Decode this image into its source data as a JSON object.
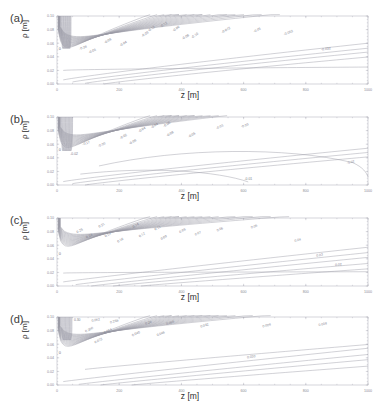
{
  "figure": {
    "faint_header": "",
    "panels": [
      {
        "tag": "(a)",
        "xlabel": "z [m]",
        "ylabel": "ρ [m]"
      },
      {
        "tag": "(b)",
        "xlabel": "z [m]",
        "ylabel": "ρ [m]"
      },
      {
        "tag": "(c)",
        "xlabel": "z [m]",
        "ylabel": "ρ [m]"
      },
      {
        "tag": "(d)",
        "xlabel": "z [m]",
        "ylabel": "ρ [m]"
      }
    ]
  },
  "chart_data": [
    {
      "type": "line",
      "panel": "(a)",
      "title": "",
      "xlabel": "z [m]",
      "ylabel": "ρ [m]",
      "xlim": [
        0,
        1000
      ],
      "ylim": [
        0.0,
        0.1
      ],
      "xticks": [
        0,
        200,
        400,
        600,
        800,
        1000
      ],
      "xticklabels": [
        "0",
        "200",
        "400",
        "600",
        "800",
        "1000"
      ],
      "yticks": [
        0.0,
        0.02,
        0.04,
        0.06,
        0.08,
        0.1
      ],
      "yticklabels": [
        "0.00",
        "0.02",
        "0.04",
        "0.06",
        "0.08",
        "0.10"
      ],
      "grid": false,
      "legend": "none",
      "contour_labels": [
        "0",
        "-0.28",
        "-0.08",
        "-0.08",
        "-0.04",
        "-0.09",
        "-0.12",
        "-0.12",
        "-0.06",
        "-0.08",
        "-0.10",
        "-0.072",
        "-0.05",
        "-0.052",
        "-0.032",
        "-0.048",
        "-0.004"
      ],
      "notes": "Contours fan out from a dense dark cluster at upper-left; one near-horizontal contour labelled -0.004 extends to the right edge."
    },
    {
      "type": "line",
      "panel": "(b)",
      "title": "",
      "xlabel": "z [m]",
      "ylabel": "ρ [m]",
      "xlim": [
        0,
        1000
      ],
      "ylim": [
        0.0,
        0.1
      ],
      "xticks": [
        0,
        200,
        400,
        600,
        800,
        1000
      ],
      "xticklabels": [
        "0",
        "200",
        "400",
        "600",
        "800",
        "1000"
      ],
      "yticks": [
        0.0,
        0.02,
        0.04,
        0.06,
        0.08,
        0.1
      ],
      "yticklabels": [
        "0.00",
        "0.02",
        "0.04",
        "0.06",
        "0.08",
        "0.10"
      ],
      "grid": false,
      "legend": "none",
      "contour_labels": [
        "0",
        "-0.02",
        "-0.17",
        "-0.08",
        "-0.02",
        "-0.06",
        "-0.04",
        "-0.04",
        "-0.06",
        "-0.08",
        "-0.05",
        "-0.03",
        "-0.03",
        "-0.01",
        "-0.02",
        "-0.01"
      ],
      "notes": "Similar fan pattern to (a) but two contours close on themselves: one arcs to the right edge near ρ=0.03 and one turns down to the axis near z=620."
    },
    {
      "type": "line",
      "panel": "(c)",
      "title": "",
      "xlabel": "z [m]",
      "ylabel": "ρ [m]",
      "xlim": [
        0,
        1000
      ],
      "ylim": [
        0.0,
        0.1
      ],
      "xticks": [
        0,
        200,
        400,
        600,
        800,
        1000
      ],
      "xticklabels": [
        "0",
        "200",
        "400",
        "600",
        "800",
        "1000"
      ],
      "yticks": [
        0.0,
        0.02,
        0.04,
        0.06,
        0.08,
        0.1
      ],
      "yticklabels": [
        "0.00",
        "0.02",
        "0.04",
        "0.06",
        "0.08",
        "0.10"
      ],
      "grid": false,
      "legend": "none",
      "contour_labels": [
        "0",
        "0.25",
        "0.24",
        "0.21",
        "0.14",
        "0.16",
        "0.14",
        "0.12",
        "0.11",
        "0.09",
        "0.08",
        "0.07",
        "0.06",
        "0.05",
        "0.04",
        "0.03",
        "0.02"
      ],
      "notes": "Nested contours bow upward from the left edge and sweep toward the upper right; lowest contours run near-horizontally to the right edge."
    },
    {
      "type": "line",
      "panel": "(d)",
      "title": "",
      "xlabel": "z [m]",
      "ylabel": "ρ [m]",
      "xlim": [
        0,
        1000
      ],
      "ylim": [
        0.0,
        0.1
      ],
      "xticks": [
        0,
        200,
        400,
        600,
        800,
        1000
      ],
      "xticklabels": [
        "0",
        "200",
        "400",
        "600",
        "800",
        "1000"
      ],
      "yticks": [
        0.0,
        0.02,
        0.04,
        0.06,
        0.08,
        0.1
      ],
      "yticklabels": [
        "0.00",
        "0.02",
        "0.04",
        "0.06",
        "0.08",
        "0.10"
      ],
      "grid": false,
      "legend": "none",
      "contour_labels": [
        "0",
        "0.30",
        "0.052",
        "0.256",
        "0.26",
        "0.055",
        "0.200",
        "0.054",
        "0.040",
        "0.046",
        "0.072",
        "0.032",
        "0.009",
        "0.008",
        "0.030"
      ],
      "notes": "Dense shaded cluster at top-left; contours fan out to the upper and lower right with a single long contour running to the right edge near ρ=0.03."
    }
  ]
}
